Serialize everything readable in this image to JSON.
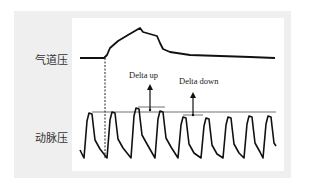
{
  "diagram": {
    "labels": {
      "airway_pressure": "气道压",
      "arterial_pressure": "动脉压",
      "delta_up": "Delta up",
      "delta_down": "Delta down"
    },
    "colors": {
      "outer_background": "#efefef",
      "panel_background": "#ffffff",
      "trace": "#111111",
      "reference_line": "#333333"
    },
    "airway_trace": [
      [
        80,
        58
      ],
      [
        104,
        58
      ],
      [
        107,
        55
      ],
      [
        110,
        48
      ],
      [
        118,
        41
      ],
      [
        128,
        35
      ],
      [
        140,
        28
      ],
      [
        143,
        32
      ],
      [
        150,
        34
      ],
      [
        157,
        36
      ],
      [
        160,
        43
      ],
      [
        163,
        49
      ],
      [
        170,
        52
      ],
      [
        190,
        55
      ],
      [
        220,
        56
      ],
      [
        250,
        57
      ],
      [
        275,
        58
      ]
    ],
    "arterial_beats": {
      "count": 9,
      "peak_x": [
        89,
        112,
        136,
        160,
        183,
        206,
        228,
        249,
        268
      ],
      "peak_y": [
        113,
        112,
        108,
        111,
        117,
        118,
        117,
        116,
        116
      ]
    },
    "reference_line": {
      "x1": 92,
      "x2": 276,
      "y": 112
    },
    "dashed_marker_x": 105,
    "delta_up": {
      "x": 150,
      "base_y": 110,
      "tip_y": 84,
      "bar_x1": 138,
      "bar_x2": 165,
      "bar_y": 107
    },
    "delta_down": {
      "x": 193,
      "base_y": 115,
      "tip_y": 92,
      "bar_x1": 183,
      "bar_x2": 203,
      "bar_y": 115
    }
  }
}
